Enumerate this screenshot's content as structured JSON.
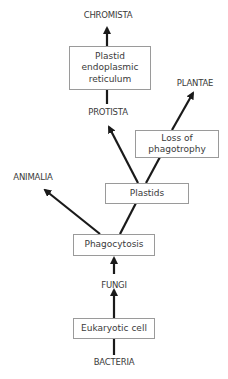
{
  "diagram": {
    "type": "evolutionary-tree",
    "taxa": {
      "chromista": "CHROMISTA",
      "plantae": "PLANTAE",
      "protista": "PROTISTA",
      "animalia": "ANIMALIA",
      "fungi": "FUNGI",
      "bacteria": "BACTERIA"
    },
    "events": {
      "plastid_er_line1": "Plastid",
      "plastid_er_line2": "endoplasmic",
      "plastid_er_line3": "reticulum",
      "loss_line1": "Loss of",
      "loss_line2": "phagotrophy",
      "plastids": "Plastids",
      "phagocytosis": "Phagocytosis",
      "eukaryotic_cell": "Eukaryotic cell"
    },
    "colors": {
      "arrow": "#1a1a1a",
      "box_border": "#9a9a9a",
      "text": "#3a3a3a"
    }
  }
}
